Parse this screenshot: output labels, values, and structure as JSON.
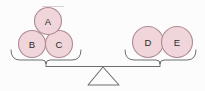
{
  "diagram": {
    "type": "balance-scale",
    "background_color": "#fdfcfc",
    "disc_fill_color": "#f0d6da",
    "disc_stroke_color": "#b08b93",
    "label_color": "#2b2b2b",
    "line_color": "#6e6e6e",
    "fulcrum_stroke_color": "#6e6e6e",
    "beam_state": "level",
    "left_pan": {
      "name": "left-pan",
      "disc_count": 3,
      "discs": [
        {
          "label": "A",
          "cx": 48,
          "cy": 21,
          "r": 13.5,
          "row": "top"
        },
        {
          "label": "B",
          "cx": 32,
          "cy": 44,
          "r": 13.5,
          "row": "bottom"
        },
        {
          "label": "C",
          "cx": 59,
          "cy": 44,
          "r": 13.5,
          "row": "bottom"
        }
      ]
    },
    "right_pan": {
      "name": "right-pan",
      "disc_count": 2,
      "discs": [
        {
          "label": "D",
          "cx": 148,
          "cy": 42,
          "r": 15.5,
          "row": "bottom"
        },
        {
          "label": "E",
          "cx": 177,
          "cy": 42,
          "r": 15.5,
          "row": "bottom"
        }
      ]
    },
    "beam": {
      "x1": 46,
      "x2": 160,
      "y": 66
    },
    "fulcrum": {
      "apex_x": 103,
      "apex_y": 67,
      "base_left_x": 88,
      "base_right_x": 119,
      "base_y": 85
    },
    "left_bracket": {
      "left_x": 11,
      "right_x": 81,
      "top_y": 50,
      "bottom_y": 62,
      "stem_x": 46
    },
    "right_bracket": {
      "left_x": 125,
      "right_x": 196,
      "top_y": 50,
      "bottom_y": 62,
      "stem_x": 160
    }
  }
}
